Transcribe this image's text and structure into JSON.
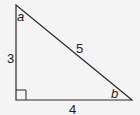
{
  "diagram": {
    "type": "right-triangle",
    "sides": {
      "vertical": "3",
      "horizontal": "4",
      "hypotenuse": "5"
    },
    "angles": {
      "top": "a",
      "bottom_right": "b"
    },
    "right_angle_at": "bottom-left",
    "stroke_color": "#2a2a2a",
    "background": "#f4f4f4"
  }
}
